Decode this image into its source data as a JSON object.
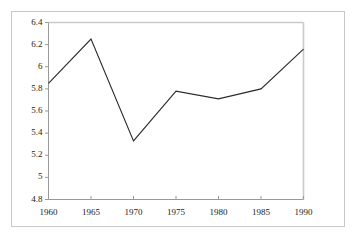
{
  "chart_data": {
    "type": "line",
    "title": "",
    "subtitle": "",
    "xlabel": "",
    "ylabel": "",
    "x": [
      1960,
      1965,
      1970,
      1975,
      1980,
      1985,
      1990
    ],
    "values": [
      5.85,
      6.25,
      5.33,
      5.78,
      5.71,
      5.8,
      6.16
    ],
    "series": [
      {
        "name": "",
        "values": [
          5.85,
          6.25,
          5.33,
          5.78,
          5.71,
          5.8,
          6.16
        ]
      }
    ],
    "xlim": [
      1960,
      1990
    ],
    "ylim": [
      4.8,
      6.4
    ],
    "xticks": [
      1960,
      1965,
      1970,
      1975,
      1980,
      1985,
      1990
    ],
    "yticks": [
      4.8,
      5,
      5.2,
      5.4,
      5.6,
      5.8,
      6,
      6.2,
      6.4
    ],
    "xtick_labels": [
      "1960",
      "1965",
      "1970",
      "1975",
      "1980",
      "1985",
      "1990"
    ],
    "ytick_labels": [
      "4.8",
      "5",
      "5.2",
      "5.4",
      "5.6",
      "5.8",
      "6",
      "6.2",
      "6.4"
    ],
    "grid": false,
    "legend": false,
    "legend_position": "none",
    "line_color": "#2b2b2b",
    "axis_color": "#999999",
    "frame_color": "#c9c9c9",
    "background_color": "#ffffff",
    "markers": false
  }
}
